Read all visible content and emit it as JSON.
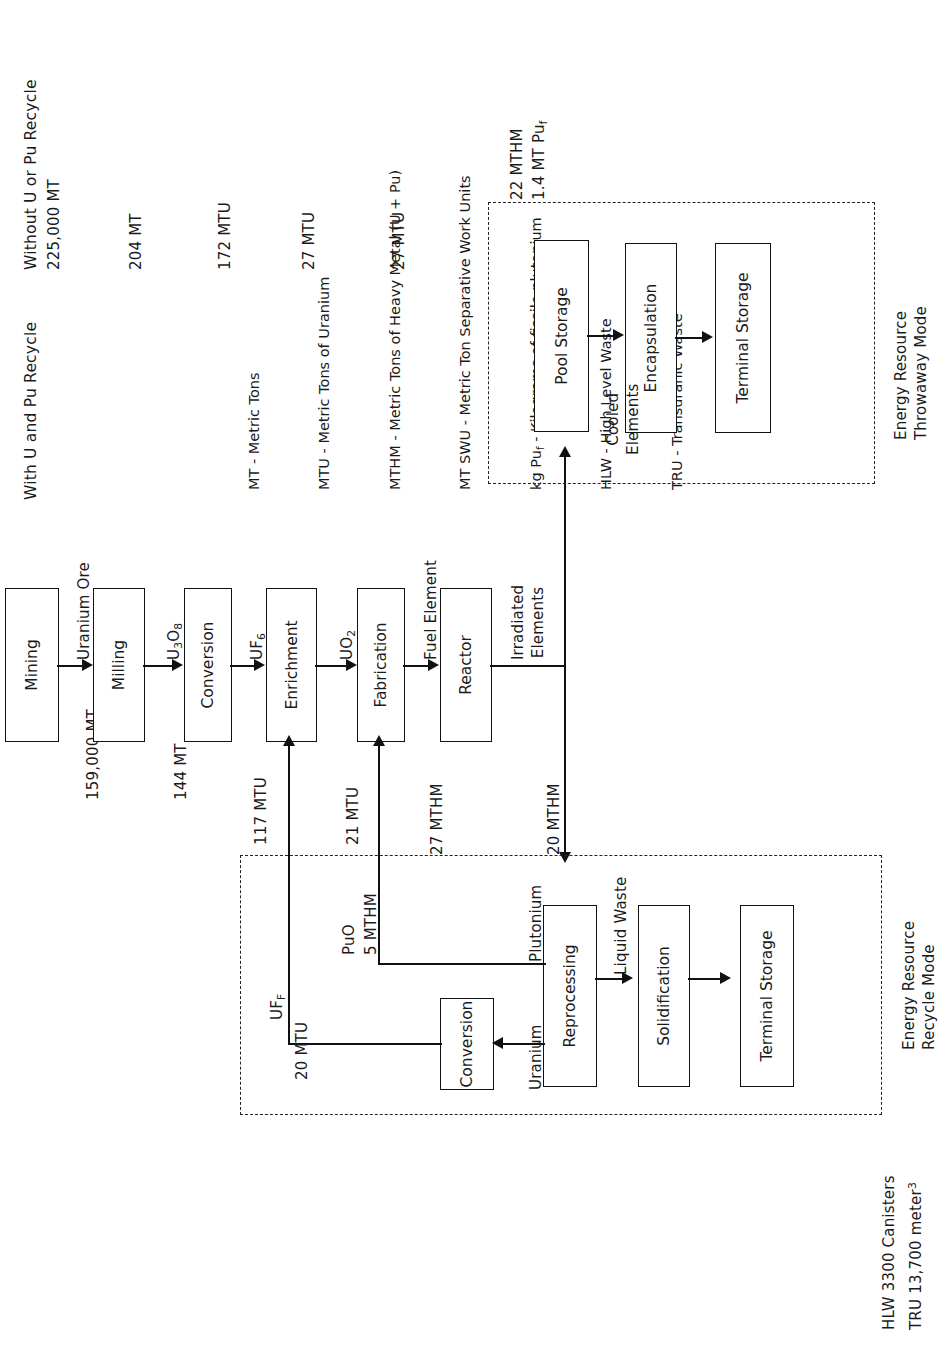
{
  "headers": {
    "recycle_mode": "With U and Pu Recycle",
    "throwaway_mode": "Without U or Pu Recycle"
  },
  "legend": {
    "lines": [
      "MT - Metric Tons",
      "MTU - Metric Tons of Uranium",
      "MTHM - Metric Tons of Heavy Metal (U + Pu)",
      "MT SWU - Metric Ton Separative Work Units",
      "kg Puf - Kilograms of fissile plutonium",
      "HLW - High Level Waste",
      "TRU - Transuranic Waste"
    ],
    "items": [
      {
        "abbr": "MT",
        "meaning": "Metric Tons"
      },
      {
        "abbr": "MTU",
        "meaning": "Metric Tons of Uranium"
      },
      {
        "abbr": "MTHM",
        "meaning": "Metric Tons of Heavy Metal (U + Pu)"
      },
      {
        "abbr": "MT SWU",
        "meaning": "Metric Ton Separative Work Units"
      },
      {
        "abbr": "kg Puf",
        "meaning": "Kilograms of fissile plutonium"
      },
      {
        "abbr": "HLW",
        "meaning": "High Level Waste"
      },
      {
        "abbr": "TRU",
        "meaning": "Transuranic Waste"
      }
    ]
  },
  "main_chain": {
    "mining": "Mining",
    "milling": "Milling",
    "conversion": "Conversion",
    "enrichment": "Enrichment",
    "fabrication": "Fabrication",
    "reactor": "Reactor"
  },
  "flow_labels": {
    "uranium_ore": "Uranium Ore",
    "u3o8": "U3O8",
    "uf6": "UF6",
    "uo2": "UO2",
    "fuel_element": "Fuel Element",
    "irradiated_elements": "Irradiated\nElements",
    "cooled_elements": "Cooled\nElements",
    "liquid_waste": "Liquid Waste",
    "plutonium": "Plutonium",
    "uranium": "Uranium",
    "uff": "UFF",
    "puo": "PuO"
  },
  "recycle_values": {
    "ore_159000": "159,000 MT",
    "mill_144": "144 MT",
    "conv_117": "117 MTU",
    "enr_21": "21 MTU",
    "fab_27": "27 MTHM",
    "reactor_20": "20 MTHM",
    "uff_20": "20 MTU",
    "puo_5": "5 MTHM"
  },
  "throwaway_values": {
    "ore_225000": "225,000 MT",
    "mill_204": "204 MT",
    "conv_172": "172 MTU",
    "enr_27": "27 MTU",
    "fab_27": "27 MTU",
    "pool_22": "22 MTHM",
    "pool_pu": "1.4 MT Puf"
  },
  "recycle_block": {
    "reprocessing": "Reprocessing",
    "conversion": "Conversion",
    "solidification": "Solidification",
    "terminal_storage": "Terminal Storage",
    "caption": "Energy Resource\nRecycle Mode",
    "caption_line1": "Energy Resource",
    "caption_line2": "Recycle Mode"
  },
  "throwaway_block": {
    "pool_storage": "Pool Storage",
    "encapsulation": "Encapsulation",
    "terminal_storage": "Terminal Storage",
    "caption_line1": "Energy Resource",
    "caption_line2": "Throwaway Mode"
  },
  "footer": {
    "line1": "HLW 3300 Canisters",
    "line2": "TRU 13,700 meter3"
  },
  "colors": {
    "ink": "#111111",
    "background": "#ffffff"
  }
}
